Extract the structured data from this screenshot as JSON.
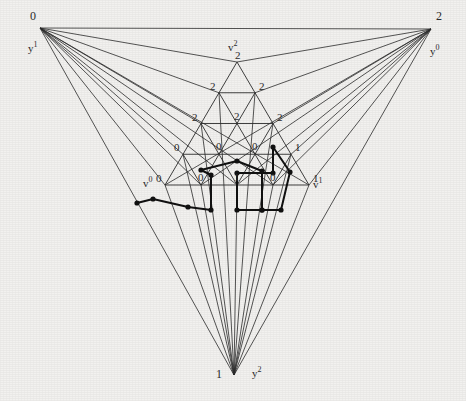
{
  "figure": {
    "background_color": "#f2f1ef",
    "line_color": "#2b2b2b",
    "path_color": "#111111",
    "outer_triangle": {
      "vertices": [
        {
          "id": "top-left",
          "x": 40,
          "y": 28,
          "label": "0",
          "sublabel": "y",
          "sup": "1"
        },
        {
          "id": "top-right",
          "x": 431,
          "y": 29,
          "label": "2",
          "sublabel": "y",
          "sup": "0"
        },
        {
          "id": "bottom",
          "x": 234,
          "y": 375,
          "label": "1",
          "sublabel": "y",
          "sup": "2"
        }
      ]
    },
    "inner_triangle": {
      "apex": {
        "x": 237,
        "y": 62,
        "label": "v",
        "sup": "2",
        "value": "2"
      },
      "left_vertex": {
        "x": 165,
        "y": 185,
        "label": "v",
        "sup": "0",
        "value": "0"
      },
      "right_vertex": {
        "x": 309,
        "y": 185,
        "label": "v",
        "sup": "1",
        "value": "1"
      },
      "rows": 5,
      "row_labels": [
        [
          "2"
        ],
        [
          "2",
          "2"
        ],
        [
          "2",
          "2",
          "2"
        ],
        [
          "0",
          "0",
          "0",
          "1"
        ],
        [
          "0",
          "0",
          "1",
          "0",
          "1"
        ]
      ]
    },
    "corner_labels": {
      "top_left_number": "0",
      "top_left_y": "y",
      "top_left_y_sup": "1",
      "top_right_number": "2",
      "top_right_y": "y",
      "top_right_y_sup": "0",
      "bottom_number": "1",
      "bottom_y": "y",
      "bottom_y_sup": "2"
    },
    "path": {
      "name": "sperner-path",
      "stroke_width": 2.0,
      "marker_radius": 2.6,
      "points": [
        {
          "x": 137,
          "y": 203
        },
        {
          "x": 153,
          "y": 199
        },
        {
          "x": 188,
          "y": 207
        },
        {
          "x": 211,
          "y": 210
        },
        {
          "x": 211,
          "y": 175
        },
        {
          "x": 201,
          "y": 170
        },
        {
          "x": 237,
          "y": 161
        },
        {
          "x": 262,
          "y": 171
        },
        {
          "x": 262,
          "y": 210
        },
        {
          "x": 237,
          "y": 210
        },
        {
          "x": 237,
          "y": 173
        },
        {
          "x": 273,
          "y": 173
        },
        {
          "x": 273,
          "y": 147
        },
        {
          "x": 290,
          "y": 172
        },
        {
          "x": 281,
          "y": 210
        },
        {
          "x": 262,
          "y": 210
        }
      ]
    }
  }
}
